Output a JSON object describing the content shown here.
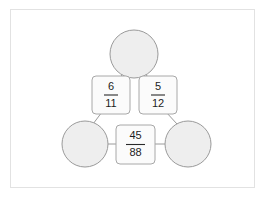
{
  "diagram": {
    "type": "node-link-graph",
    "background_color": "#ffffff",
    "frame_color": "#e2e2e2",
    "node_fill": "#eeeeee",
    "node_stroke": "#9a9a9a",
    "box_fill": "#fbfbfb",
    "box_stroke": "#a8a8a8",
    "edge_color": "#9a9a9a",
    "text_color": "#1d1d1d",
    "circles": [
      {
        "id": "top-circle",
        "label": "",
        "cx": 134,
        "cy": 54,
        "r": 24
      },
      {
        "id": "bottom-left-circle",
        "label": "",
        "cx": 85,
        "cy": 144,
        "r": 23
      },
      {
        "id": "bottom-right-circle",
        "label": "",
        "cx": 188,
        "cy": 144,
        "r": 23
      }
    ],
    "fraction_boxes": [
      {
        "id": "box-left",
        "numerator": "6",
        "denominator": "11",
        "x": 92,
        "y": 76,
        "w": 38,
        "h": 38
      },
      {
        "id": "box-right",
        "numerator": "5",
        "denominator": "12",
        "x": 139,
        "y": 76,
        "w": 38,
        "h": 38
      },
      {
        "id": "box-bottom",
        "numerator": "45",
        "denominator": "88",
        "x": 116,
        "y": 125,
        "w": 39,
        "h": 39
      }
    ],
    "edges": [
      {
        "from": "top-circle",
        "to": "box-left"
      },
      {
        "from": "top-circle",
        "to": "box-right"
      },
      {
        "from": "box-left",
        "to": "bottom-left-circle"
      },
      {
        "from": "box-right",
        "to": "bottom-right-circle"
      },
      {
        "from": "bottom-left-circle",
        "to": "box-bottom"
      },
      {
        "from": "box-bottom",
        "to": "bottom-right-circle"
      }
    ]
  }
}
